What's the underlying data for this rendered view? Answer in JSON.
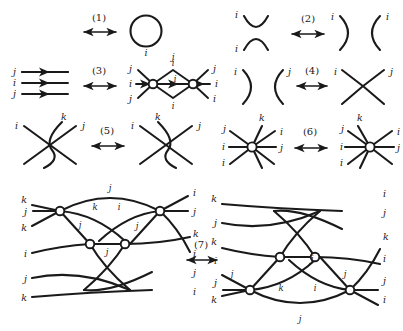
{
  "figure": {
    "relations": [
      {
        "id": "1",
        "tag": "(1)",
        "arrow": "double-headed-horizontal",
        "left": {
          "description": "empty diagram",
          "labels": []
        },
        "right": {
          "description": "closed circle loop",
          "labels": [
            "i"
          ]
        }
      },
      {
        "id": "2",
        "tag": "(2)",
        "arrow": "double-headed-horizontal",
        "left": {
          "description": "cap over cup (vertical X of arcs)",
          "labels": [
            "i",
            "i"
          ]
        },
        "right": {
          "description": "two opposing arcs )(",
          "labels": [
            "i",
            "i"
          ]
        }
      },
      {
        "id": "3",
        "tag": "(3)",
        "arrow": "double-headed-horizontal",
        "left": {
          "description": "three parallel directed strands",
          "labels": [
            "j",
            "i",
            "j"
          ]
        },
        "right": {
          "description": "lens/theta graph with two trivalent-plus vertices",
          "labels": [
            "i",
            "j",
            "i",
            "j",
            "i",
            "j",
            "i",
            "j",
            "i"
          ]
        }
      },
      {
        "id": "4",
        "tag": "(4)",
        "arrow": "double-headed-horizontal",
        "left": {
          "description": "two opposing arcs )(",
          "labels": [
            "i",
            "j"
          ]
        },
        "right": {
          "description": "single crossing X",
          "labels": [
            "i",
            "j"
          ]
        }
      },
      {
        "id": "5",
        "tag": "(5)",
        "arrow": "double-headed-horizontal",
        "left": {
          "description": "three-strand braid, Reidemeister III left form",
          "labels": [
            "i",
            "k",
            "j"
          ]
        },
        "right": {
          "description": "three-strand braid, Reidemeister III right form",
          "labels": [
            "i",
            "k",
            "j"
          ]
        }
      },
      {
        "id": "6",
        "tag": "(6)",
        "arrow": "double-headed-horizontal",
        "left": {
          "description": "six-valent vertex star",
          "labels": [
            "j",
            "k",
            "i",
            "i",
            "j",
            "i"
          ]
        },
        "right": {
          "description": "six-valent vertex star, reflected",
          "labels": [
            "j",
            "k",
            "i",
            "i",
            "j",
            "i"
          ]
        }
      },
      {
        "id": "7",
        "tag": "(7)",
        "arrow": "double-headed-horizontal",
        "left": {
          "description": "six-strand tangle with three circular vertices, long j arc over the top",
          "left_labels": [
            "k",
            "j",
            "k",
            "i",
            "j",
            "k"
          ],
          "right_labels": [
            "i",
            "j",
            "k",
            "i",
            "j",
            "i"
          ],
          "inner_labels": [
            "j",
            "k",
            "i",
            "j",
            "j",
            "j"
          ]
        },
        "right": {
          "description": "six-strand tangle with three circular vertices, long j arc under the bottom (vertical mirror)",
          "left_labels": [
            "k",
            "j",
            "k",
            "i",
            "j",
            "k"
          ],
          "right_labels": [
            "i",
            "j",
            "k",
            "i",
            "j",
            "i"
          ],
          "inner_labels": [
            "j",
            "j",
            "k",
            "i",
            "j",
            "j"
          ]
        }
      }
    ],
    "strand_labels": {
      "i": "i",
      "j": "j",
      "k": "k"
    },
    "colors": {
      "ink": "#1a1a1a",
      "paper": "#ffffff",
      "vertex_fill": "#ffffff"
    }
  }
}
